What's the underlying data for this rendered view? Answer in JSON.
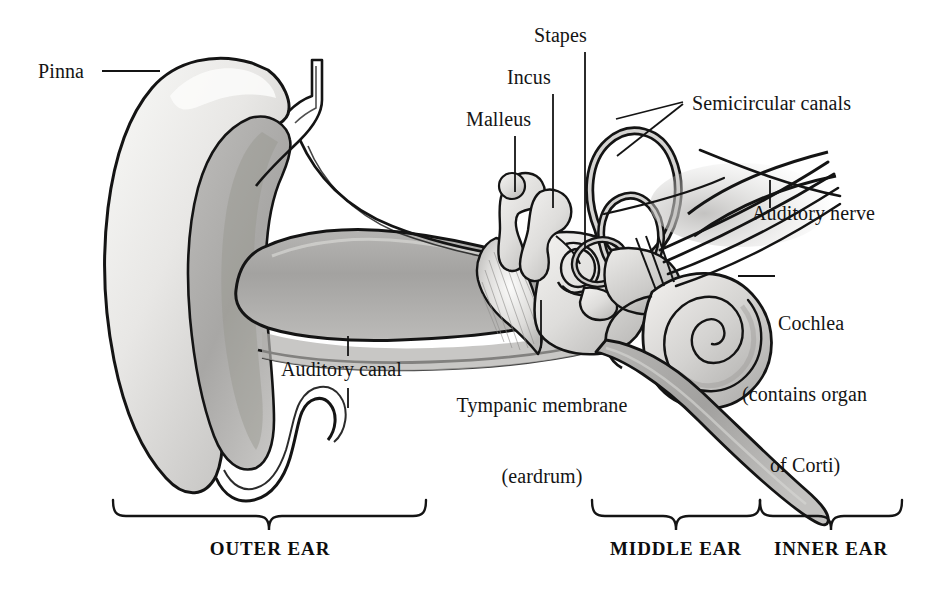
{
  "figure": {
    "background_color": "#ffffff",
    "ink_color": "#141414"
  },
  "labels": {
    "pinna": "Pinna",
    "malleus": "Malleus",
    "incus": "Incus",
    "stapes": "Stapes",
    "semicircular_canals": "Semicircular canals",
    "auditory_nerve": "Auditory nerve",
    "cochlea_line1": "Cochlea",
    "cochlea_line2": "(contains organ",
    "cochlea_line3": "of Corti)",
    "auditory_canal": "Auditory canal",
    "tympanic_membrane_line1": "Tympanic membrane",
    "tympanic_membrane_line2": "(eardrum)"
  },
  "sections": {
    "outer_ear": "OUTER EAR",
    "middle_ear": "MIDDLE EAR",
    "inner_ear": "INNER EAR"
  },
  "palette": {
    "outline": "#141414",
    "cartilage_light": "#efefed",
    "cartilage_mid": "#c9c8c6",
    "canal_gray": "#a9a8a6",
    "bone_light": "#e4e3e1",
    "bone_mid": "#bdbcba",
    "shadow": "#8f8e8c"
  }
}
